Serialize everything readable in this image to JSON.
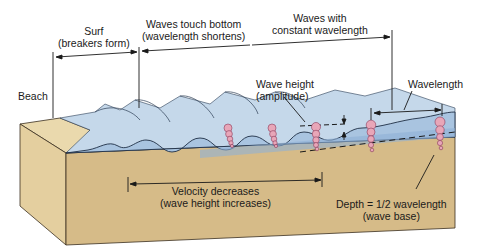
{
  "diagram": {
    "colors": {
      "sand_top": "#ead9ad",
      "sand_front": "#d6bb88",
      "sand_side": "#e4cf9f",
      "water_light": "#c5d8ea",
      "water_mid": "#a9c4e0",
      "water_deep": "#8fb0d6",
      "orbit_pink": "#e8a6b8",
      "orbit_stroke": "#8a3a5a",
      "line": "#1a1a1a"
    },
    "labels": {
      "surf": {
        "line1": "Surf",
        "line2": "(breakers form)"
      },
      "waves_touch_bottom": {
        "line1": "Waves touch bottom",
        "line2": "(wavelength shortens)"
      },
      "waves_constant": {
        "line1": "Waves with",
        "line2": "constant wavelength"
      },
      "beach": "Beach",
      "wave_height": {
        "line1": "Wave height",
        "line2": "(amplitude)"
      },
      "wavelength": "Wavelength",
      "velocity": {
        "line1": "Velocity decreases",
        "line2": "(wave height increases)"
      },
      "depth": {
        "line1": "Depth = 1/2 wavelength",
        "line2": "(wave base)"
      }
    }
  }
}
